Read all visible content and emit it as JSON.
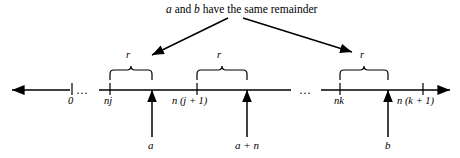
{
  "figure": {
    "caption": {
      "prefix": "",
      "var_a": "a",
      "middle": " and ",
      "var_b": "b",
      "suffix": " have the same remainder",
      "full_text": "a and b have the same remainder"
    },
    "axis": {
      "name": "number-line",
      "left_arrowhead": "left-arrow",
      "right_arrowhead": "right-arrow",
      "gap_markers": [
        "…",
        "…"
      ],
      "gap_marker_1": "…",
      "gap_marker_2": "…"
    },
    "ticks": [
      {
        "id": "zero",
        "label": "0",
        "italic": false,
        "x": 72
      },
      {
        "id": "nj",
        "label": "nj",
        "italic": true,
        "x": 110
      },
      {
        "id": "njplus1",
        "label": "n (j + 1)",
        "italic": true,
        "x": 197
      },
      {
        "id": "nk",
        "label": "nk",
        "italic": true,
        "x": 340
      },
      {
        "id": "nkplus1",
        "label": "n (k + 1)",
        "italic": true,
        "x": 423
      }
    ],
    "tick_labels": {
      "zero": "0",
      "nj": "nj",
      "njplus1": "n (j + 1)",
      "nk": "nk",
      "nkplus1": "n (k + 1)"
    },
    "braces": [
      {
        "id": "brace-r-1",
        "label": "r",
        "from_x": 110,
        "to_x": 152,
        "label_x": 126,
        "label_y": 55
      },
      {
        "id": "brace-r-2",
        "label": "r",
        "from_x": 197,
        "to_x": 247,
        "label_x": 217,
        "label_y": 55
      },
      {
        "id": "brace-r-3",
        "label": "r",
        "from_x": 340,
        "to_x": 388,
        "label_x": 360,
        "label_y": 55
      }
    ],
    "brace_label": "r",
    "markers": [
      {
        "id": "marker-a",
        "label": "a",
        "x": 152
      },
      {
        "id": "marker-a-plus-n",
        "label": "a + n",
        "x": 247
      },
      {
        "id": "marker-b",
        "label": "b",
        "x": 388
      }
    ],
    "marker_labels": {
      "a": "a",
      "a_plus_n": "a + n",
      "b": "b"
    },
    "colors": {
      "stroke": "#000000",
      "background": "#ffffff"
    }
  }
}
